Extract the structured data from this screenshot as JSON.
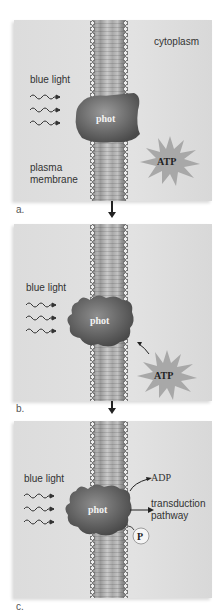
{
  "panels": [
    {
      "id": "a",
      "label": "a.",
      "cytoplasm": "cytoplasm",
      "light": "blue light",
      "protein": "phot",
      "atp": "ATP",
      "membrane_line1": "plasma",
      "membrane_line2": "membrane"
    },
    {
      "id": "b",
      "label": "b.",
      "light": "blue light",
      "protein": "phot",
      "atp": "ATP"
    },
    {
      "id": "c",
      "label": "c.",
      "light": "blue light",
      "protein": "phot",
      "adp": "ADP",
      "pathway_line1": "transduction",
      "pathway_line2": "pathway",
      "phosphate": "P"
    }
  ],
  "colors": {
    "background": "#ffffff",
    "panel": "#dedede",
    "protein": "#6e6e6e",
    "atp_burst": "#a8a8a8",
    "arrow": "#222222"
  }
}
